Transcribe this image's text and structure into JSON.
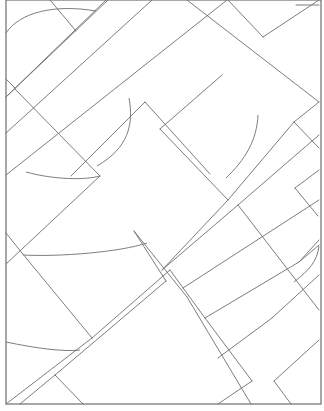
{
  "drawing": {
    "width": 324,
    "height": 411,
    "background": "#ffffff",
    "stroke": "#6e6e6e",
    "stroke_width": 0.9,
    "frame": {
      "x": 6,
      "y": 0,
      "w": 315,
      "h": 404
    },
    "lines": [
      [
        50,
        0,
        76,
        31
      ],
      [
        6,
        97,
        108,
        0
      ],
      [
        6,
        79,
        15,
        88
      ],
      [
        14,
        88,
        100,
        176
      ],
      [
        106,
        0,
        6,
        97
      ],
      [
        152,
        0,
        6,
        133
      ],
      [
        100,
        176,
        6,
        264
      ],
      [
        145,
        102,
        71,
        176
      ],
      [
        145,
        102,
        210,
        174
      ],
      [
        187,
        0,
        319,
        102
      ],
      [
        228,
        0,
        263,
        37
      ],
      [
        263,
        37,
        319,
        0
      ],
      [
        227,
        0,
        6,
        175
      ],
      [
        222,
        75,
        160,
        129
      ],
      [
        160,
        129,
        228,
        200
      ],
      [
        228,
        200,
        162,
        270
      ],
      [
        319,
        102,
        294,
        122
      ],
      [
        294,
        122,
        228,
        200
      ],
      [
        294,
        122,
        319,
        148
      ],
      [
        319,
        135,
        238,
        205
      ],
      [
        238,
        205,
        162,
        270
      ],
      [
        296,
        5,
        319,
        5
      ],
      [
        6,
        233,
        22,
        253
      ],
      [
        22,
        253,
        92,
        338
      ],
      [
        92,
        338,
        6,
        404
      ],
      [
        92,
        338,
        170,
        270
      ],
      [
        170,
        270,
        205,
        318
      ],
      [
        205,
        318,
        252,
        381
      ],
      [
        252,
        381,
        218,
        404
      ],
      [
        205,
        318,
        299,
        262
      ],
      [
        299,
        262,
        319,
        240
      ],
      [
        238,
        205,
        319,
        310
      ],
      [
        319,
        275,
        272,
        318
      ],
      [
        272,
        318,
        218,
        358
      ],
      [
        134,
        231,
        187,
        297
      ],
      [
        187,
        297,
        251,
        404
      ],
      [
        166,
        281,
        100,
        337
      ],
      [
        100,
        337,
        55,
        375
      ],
      [
        55,
        375,
        83,
        404
      ],
      [
        299,
        262,
        319,
        245
      ],
      [
        319,
        340,
        274,
        381
      ],
      [
        274,
        381,
        291,
        404
      ],
      [
        166,
        281,
        134,
        231
      ],
      [
        55,
        375,
        20,
        404
      ],
      [
        183,
        288,
        319,
        200
      ],
      [
        319,
        170,
        295,
        188
      ],
      [
        295,
        188,
        318,
        216
      ]
    ],
    "arcs": [
      {
        "d": "M6,33 C20,12 55,4 96,11"
      },
      {
        "d": "M129,98 C134,125 128,148 97,166"
      },
      {
        "d": "M26,172 C55,180 86,180 100,176"
      },
      {
        "d": "M258,115 C257,140 245,160 226,178"
      },
      {
        "d": "M23,255 C60,257 120,252 147,243"
      },
      {
        "d": "M6,342 C35,348 62,352 80,350"
      },
      {
        "d": "M319,246 C317,262 309,270 294,282"
      }
    ]
  }
}
